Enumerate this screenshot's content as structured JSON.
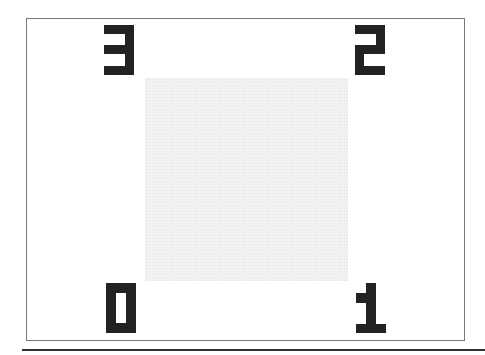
{
  "screen": {
    "description": "Corner-labelled calibration frame with center gray square",
    "frame_color": "#777777",
    "digit_color": "#222222",
    "center_fill": "#f2f2f2"
  },
  "corners": [
    {
      "position": "top-left",
      "label": "3"
    },
    {
      "position": "top-right",
      "label": "2"
    },
    {
      "position": "bottom-left",
      "label": "0"
    },
    {
      "position": "bottom-right",
      "label": "1"
    }
  ]
}
